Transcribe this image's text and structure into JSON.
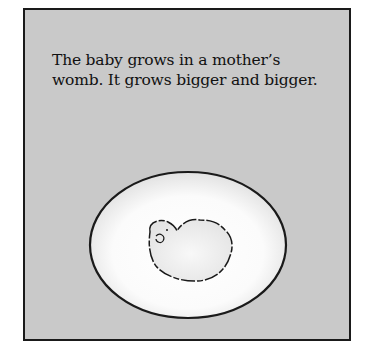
{
  "page": {
    "caption_line1": "The baby grows in a mother’s",
    "caption_line2": "womb. It grows bigger and bigger.",
    "illustration": {
      "subject": "embryo inside womb",
      "background_color": "#c9c9c9",
      "womb_color": "#f7f7f7",
      "outline_color": "#1a1a1a"
    }
  }
}
